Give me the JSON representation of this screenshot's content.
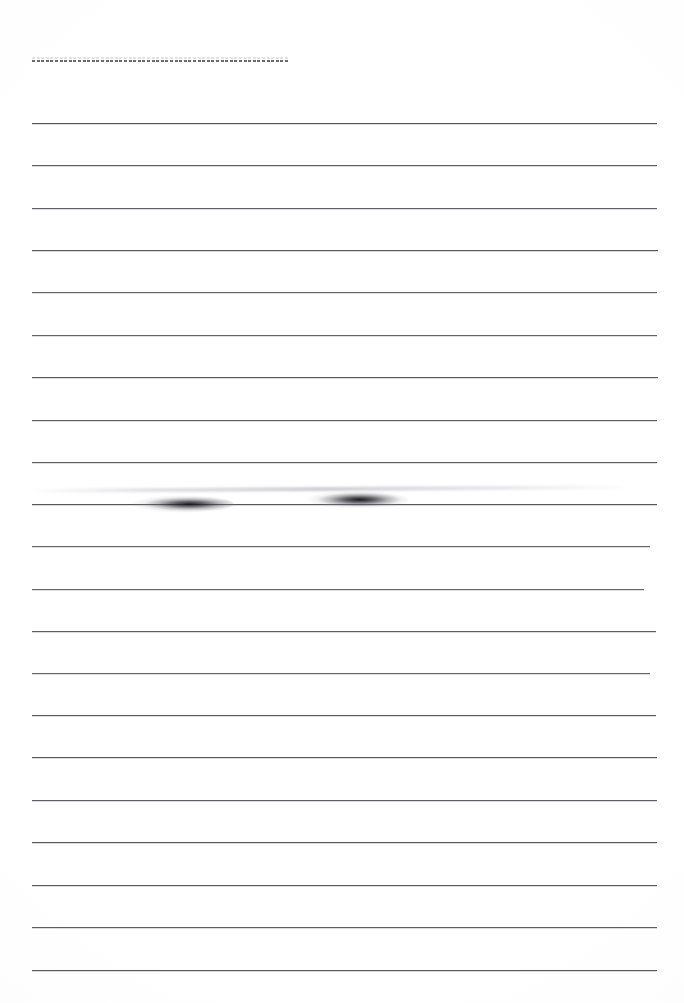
{
  "document": {
    "kind": "scanned-lined-paper",
    "title": "Blank Ruled Notebook Page (Scan)",
    "page_width": 684,
    "page_height": 1003,
    "background_color": "#ffffff",
    "ink_color": "#4c4c52",
    "content_text": ""
  },
  "layout": {
    "left_margin_x": 32,
    "right_edge_x": 656,
    "line_spacing": 42.3,
    "first_line_y": 123,
    "line_count": 21
  },
  "header_rule": {
    "name": "dashed-tear-line",
    "y": 60,
    "x_start": 32,
    "x_end": 290,
    "width": 258,
    "style": "dashed",
    "dash_length": 3,
    "dash_gap": 1.6,
    "color": "#55555c",
    "label": ""
  },
  "ruled_lines": [
    {
      "index": 1,
      "y": 123,
      "x_start": 32,
      "x_end": 657,
      "opacity": 0.95
    },
    {
      "index": 2,
      "y": 165,
      "x_start": 32,
      "x_end": 657,
      "opacity": 0.9
    },
    {
      "index": 3,
      "y": 208,
      "x_start": 32,
      "x_end": 657,
      "opacity": 0.88
    },
    {
      "index": 4,
      "y": 250,
      "x_start": 32,
      "x_end": 658,
      "opacity": 0.93
    },
    {
      "index": 5,
      "y": 292,
      "x_start": 32,
      "x_end": 657,
      "opacity": 0.86
    },
    {
      "index": 6,
      "y": 335,
      "x_start": 32,
      "x_end": 657,
      "opacity": 0.88
    },
    {
      "index": 7,
      "y": 377,
      "x_start": 32,
      "x_end": 658,
      "opacity": 0.92
    },
    {
      "index": 8,
      "y": 420,
      "x_start": 32,
      "x_end": 657,
      "opacity": 0.89
    },
    {
      "index": 9,
      "y": 462,
      "x_start": 32,
      "x_end": 657,
      "opacity": 0.9
    },
    {
      "index": 10,
      "y": 504,
      "x_start": 32,
      "x_end": 657,
      "opacity": 0.95
    },
    {
      "index": 11,
      "y": 546,
      "x_start": 32,
      "x_end": 650,
      "opacity": 0.86
    },
    {
      "index": 12,
      "y": 589,
      "x_start": 32,
      "x_end": 644,
      "opacity": 0.85
    },
    {
      "index": 13,
      "y": 631,
      "x_start": 32,
      "x_end": 656,
      "opacity": 0.9
    },
    {
      "index": 14,
      "y": 673,
      "x_start": 32,
      "x_end": 650,
      "opacity": 0.86
    },
    {
      "index": 15,
      "y": 715,
      "x_start": 32,
      "x_end": 656,
      "opacity": 0.9
    },
    {
      "index": 16,
      "y": 757,
      "x_start": 32,
      "x_end": 657,
      "opacity": 0.92
    },
    {
      "index": 17,
      "y": 800,
      "x_start": 32,
      "x_end": 657,
      "opacity": 0.9
    },
    {
      "index": 18,
      "y": 842,
      "x_start": 32,
      "x_end": 657,
      "opacity": 0.92
    },
    {
      "index": 19,
      "y": 885,
      "x_start": 32,
      "x_end": 657,
      "opacity": 0.91
    },
    {
      "index": 20,
      "y": 927,
      "x_start": 32,
      "x_end": 657,
      "opacity": 0.9
    },
    {
      "index": 21,
      "y": 970,
      "x_start": 32,
      "x_end": 657,
      "opacity": 0.93
    }
  ],
  "artifacts": {
    "smudges": [
      {
        "name": "ink-smudge-left",
        "x": 116,
        "y": 495,
        "width": 118,
        "height": 18
      },
      {
        "name": "ink-smudge-right",
        "x": 300,
        "y": 491,
        "width": 108,
        "height": 18
      }
    ],
    "ghost_streaks": [
      {
        "name": "scan-ghost-streak",
        "x": 32,
        "y": 487,
        "width": 600,
        "height": 4,
        "rotate_deg": -0.35
      }
    ]
  }
}
